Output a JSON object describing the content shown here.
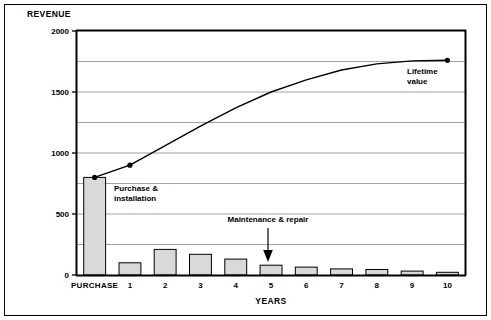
{
  "chart_data": {
    "type": "bar",
    "title": "",
    "subtitle": "",
    "ylabel": "REVENUE",
    "xlabel": "YEARS",
    "categories": [
      "PURCHASE",
      "1",
      "2",
      "3",
      "4",
      "5",
      "6",
      "7",
      "8",
      "9",
      "10"
    ],
    "ylim": [
      0,
      2000
    ],
    "yticks": [
      0,
      500,
      1000,
      1500,
      2000
    ],
    "ytick_labels": [
      "0",
      "500",
      "1000",
      "1500",
      "2000"
    ],
    "gridlines": [
      0,
      250,
      500,
      750,
      1000,
      1250,
      1500,
      1750,
      2000
    ],
    "grid": true,
    "legend": "none",
    "series": [
      {
        "name": "Cost",
        "type": "bar",
        "color": "#d9d9d9",
        "edge_color": "#000000",
        "values": [
          800,
          100,
          210,
          170,
          130,
          80,
          65,
          50,
          45,
          32,
          22
        ]
      },
      {
        "name": "Cumulative lifetime value",
        "type": "line",
        "color": "#000000",
        "x": [
          "PURCHASE",
          "1",
          "2",
          "3",
          "4",
          "5",
          "6",
          "7",
          "8",
          "9",
          "10"
        ],
        "values": [
          800,
          900,
          1060,
          1220,
          1370,
          1500,
          1600,
          1680,
          1730,
          1755,
          1760
        ],
        "markers_at": [
          "PURCHASE",
          "1",
          "10"
        ]
      }
    ],
    "annotations": [
      {
        "id": "purchase-installation",
        "text_lines": [
          "Purchase &",
          "installation"
        ],
        "anchor_value": 800,
        "anchor_category": "PURCHASE",
        "has_arrow": false
      },
      {
        "id": "maintenance-repair",
        "text_lines": [
          "Maintenance  &  repair"
        ],
        "anchor_value": 80,
        "anchor_category": "5",
        "has_arrow": true,
        "arrow_direction": "down"
      },
      {
        "id": "lifetime-value",
        "text_lines": [
          "Lifetime",
          "value"
        ],
        "anchor_value": 1760,
        "anchor_category": "10",
        "has_arrow": false
      }
    ]
  },
  "colors": {
    "bar_fill": "#d9d9d9",
    "bar_edge": "#000000",
    "line": "#000000",
    "grid": "#8a8a8a",
    "axis": "#000000",
    "text": "#000000",
    "background": "#ffffff",
    "frame": "#000000"
  }
}
